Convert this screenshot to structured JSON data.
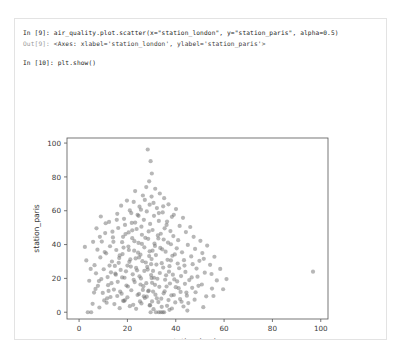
{
  "notebook": {
    "cells": [
      {
        "prompt": "In [9]:",
        "type": "input",
        "source": "air_quality.plot.scatter(x=\"station_london\", y=\"station_paris\", alpha=0.5)"
      },
      {
        "prompt": "Out[9]:",
        "type": "output",
        "source": "<Axes: xlabel='station_london', ylabel='station_paris'>"
      },
      {
        "prompt": "In [10]:",
        "type": "input",
        "source": "plt.show()"
      }
    ]
  },
  "colors": {
    "marker": "#6f6f6f",
    "axis": "#555555",
    "card_border": "#e3e3e3",
    "text": "#262626",
    "prompt_out": "#9a9a9a"
  },
  "chart_data": {
    "type": "scatter",
    "title": "",
    "xlabel": "station_london",
    "ylabel": "station_paris",
    "xlim": [
      -5,
      103
    ],
    "ylim": [
      -4,
      103
    ],
    "xticks": [
      0,
      20,
      40,
      60,
      80,
      100
    ],
    "yticks": [
      0,
      20,
      40,
      60,
      80,
      100
    ],
    "grid": false,
    "legend": false,
    "marker_alpha": 0.5,
    "marker_color": "#6f6f6f",
    "marker_size": 2.1,
    "series": [
      {
        "name": "station_london vs station_paris",
        "points": [
          [
            28.4,
            96.2
          ],
          [
            29.6,
            89.3
          ],
          [
            30.1,
            82.0
          ],
          [
            29.0,
            77.4
          ],
          [
            27.8,
            74.0
          ],
          [
            31.5,
            73.0
          ],
          [
            23.2,
            71.6
          ],
          [
            33.4,
            70.2
          ],
          [
            26.4,
            69.0
          ],
          [
            35.2,
            67.4
          ],
          [
            19.8,
            66.0
          ],
          [
            22.6,
            65.2
          ],
          [
            30.8,
            64.6
          ],
          [
            37.0,
            63.8
          ],
          [
            17.4,
            63.0
          ],
          [
            25.0,
            62.4
          ],
          [
            32.2,
            61.6
          ],
          [
            40.1,
            61.0
          ],
          [
            21.0,
            60.2
          ],
          [
            28.0,
            59.6
          ],
          [
            34.6,
            59.0
          ],
          [
            15.8,
            58.2
          ],
          [
            24.2,
            57.6
          ],
          [
            31.0,
            57.0
          ],
          [
            38.4,
            56.4
          ],
          [
            43.0,
            55.8
          ],
          [
            18.6,
            55.2
          ],
          [
            26.8,
            54.6
          ],
          [
            33.0,
            54.0
          ],
          [
            12.4,
            53.4
          ],
          [
            21.8,
            52.8
          ],
          [
            29.4,
            52.2
          ],
          [
            36.2,
            51.6
          ],
          [
            41.6,
            51.0
          ],
          [
            46.0,
            50.4
          ],
          [
            16.2,
            49.8
          ],
          [
            23.8,
            49.2
          ],
          [
            30.4,
            48.6
          ],
          [
            37.8,
            48.0
          ],
          [
            44.2,
            47.4
          ],
          [
            10.8,
            46.8
          ],
          [
            19.2,
            46.2
          ],
          [
            26.0,
            45.8
          ],
          [
            32.6,
            45.4
          ],
          [
            39.0,
            45.0
          ],
          [
            47.4,
            44.6
          ],
          [
            14.0,
            44.2
          ],
          [
            22.0,
            43.8
          ],
          [
            28.6,
            43.4
          ],
          [
            35.0,
            43.0
          ],
          [
            41.0,
            42.6
          ],
          [
            50.2,
            42.2
          ],
          [
            9.4,
            41.8
          ],
          [
            17.8,
            41.4
          ],
          [
            24.6,
            41.0
          ],
          [
            31.2,
            40.6
          ],
          [
            38.0,
            40.2
          ],
          [
            45.0,
            39.8
          ],
          [
            53.0,
            39.4
          ],
          [
            12.8,
            39.0
          ],
          [
            20.4,
            38.8
          ],
          [
            27.0,
            38.4
          ],
          [
            33.6,
            38.0
          ],
          [
            40.4,
            37.8
          ],
          [
            48.0,
            37.4
          ],
          [
            7.6,
            37.0
          ],
          [
            15.4,
            36.8
          ],
          [
            22.8,
            36.4
          ],
          [
            29.2,
            36.0
          ],
          [
            35.8,
            35.8
          ],
          [
            42.6,
            35.4
          ],
          [
            51.0,
            35.0
          ],
          [
            11.2,
            34.8
          ],
          [
            18.0,
            34.4
          ],
          [
            25.4,
            34.0
          ],
          [
            31.8,
            33.8
          ],
          [
            38.6,
            33.4
          ],
          [
            46.4,
            33.0
          ],
          [
            56.0,
            32.8
          ],
          [
            8.8,
            32.4
          ],
          [
            16.6,
            32.0
          ],
          [
            23.4,
            31.8
          ],
          [
            30.0,
            31.4
          ],
          [
            36.6,
            31.0
          ],
          [
            43.4,
            30.8
          ],
          [
            49.8,
            30.4
          ],
          [
            13.6,
            30.0
          ],
          [
            20.8,
            29.8
          ],
          [
            27.6,
            29.4
          ],
          [
            34.2,
            29.0
          ],
          [
            40.8,
            28.8
          ],
          [
            47.0,
            28.4
          ],
          [
            54.2,
            28.0
          ],
          [
            6.4,
            27.8
          ],
          [
            14.8,
            27.4
          ],
          [
            21.4,
            27.0
          ],
          [
            28.2,
            26.8
          ],
          [
            34.8,
            26.4
          ],
          [
            41.4,
            26.0
          ],
          [
            48.6,
            25.8
          ],
          [
            10.2,
            25.4
          ],
          [
            17.2,
            25.0
          ],
          [
            24.0,
            24.8
          ],
          [
            30.6,
            24.4
          ],
          [
            37.2,
            24.0
          ],
          [
            44.0,
            23.8
          ],
          [
            52.0,
            23.4
          ],
          [
            96.8,
            24.0
          ],
          [
            7.0,
            23.0
          ],
          [
            15.0,
            22.8
          ],
          [
            22.2,
            22.4
          ],
          [
            29.8,
            22.0
          ],
          [
            36.0,
            21.8
          ],
          [
            42.2,
            21.4
          ],
          [
            49.0,
            21.0
          ],
          [
            11.8,
            20.8
          ],
          [
            18.8,
            20.4
          ],
          [
            25.6,
            20.0
          ],
          [
            32.4,
            19.8
          ],
          [
            39.4,
            19.4
          ],
          [
            45.6,
            19.0
          ],
          [
            57.0,
            18.8
          ],
          [
            8.2,
            18.4
          ],
          [
            16.0,
            18.0
          ],
          [
            23.0,
            17.8
          ],
          [
            30.2,
            17.4
          ],
          [
            37.6,
            17.0
          ],
          [
            43.8,
            16.8
          ],
          [
            50.8,
            16.4
          ],
          [
            12.0,
            16.0
          ],
          [
            19.6,
            15.8
          ],
          [
            26.6,
            15.4
          ],
          [
            33.2,
            15.0
          ],
          [
            40.0,
            14.8
          ],
          [
            46.8,
            14.4
          ],
          [
            55.0,
            14.0
          ],
          [
            6.8,
            13.8
          ],
          [
            14.4,
            13.4
          ],
          [
            21.6,
            13.0
          ],
          [
            28.8,
            12.8
          ],
          [
            35.4,
            12.4
          ],
          [
            42.0,
            12.0
          ],
          [
            48.2,
            11.8
          ],
          [
            9.8,
            11.4
          ],
          [
            17.6,
            11.0
          ],
          [
            24.8,
            10.8
          ],
          [
            31.6,
            10.4
          ],
          [
            38.2,
            10.0
          ],
          [
            44.6,
            9.8
          ],
          [
            52.6,
            9.4
          ],
          [
            13.0,
            9.0
          ],
          [
            20.0,
            8.8
          ],
          [
            27.2,
            8.4
          ],
          [
            34.0,
            8.0
          ],
          [
            41.8,
            7.8
          ],
          [
            47.8,
            7.4
          ],
          [
            10.4,
            7.0
          ],
          [
            18.2,
            6.8
          ],
          [
            25.2,
            6.4
          ],
          [
            32.8,
            6.0
          ],
          [
            39.8,
            5.8
          ],
          [
            45.2,
            5.4
          ],
          [
            5.6,
            5.0
          ],
          [
            14.6,
            4.8
          ],
          [
            22.4,
            4.4
          ],
          [
            29.2,
            4.0
          ],
          [
            36.4,
            3.8
          ],
          [
            43.2,
            3.4
          ],
          [
            51.4,
            3.0
          ],
          [
            8.4,
            2.8
          ],
          [
            16.8,
            2.4
          ],
          [
            23.6,
            2.0
          ],
          [
            30.8,
            1.8
          ],
          [
            37.4,
            1.4
          ],
          [
            44.8,
            1.0
          ],
          [
            3.6,
            0.0
          ],
          [
            5.0,
            0.0
          ],
          [
            29.6,
            0.0
          ],
          [
            31.8,
            0.0
          ],
          [
            33.0,
            0.0
          ],
          [
            33.8,
            0.0
          ],
          [
            34.6,
            0.0
          ],
          [
            35.2,
            0.0
          ],
          [
            20.5,
            47.2
          ],
          [
            25.8,
            50.6
          ],
          [
            33.8,
            46.4
          ],
          [
            27.4,
            44.0
          ],
          [
            22.9,
            42.0
          ],
          [
            31.4,
            39.2
          ],
          [
            36.8,
            41.2
          ],
          [
            18.4,
            38.2
          ],
          [
            24.4,
            35.2
          ],
          [
            29.0,
            33.2
          ],
          [
            34.4,
            37.2
          ],
          [
            39.6,
            34.2
          ],
          [
            21.2,
            31.2
          ],
          [
            26.2,
            30.2
          ],
          [
            32.0,
            28.2
          ],
          [
            37.4,
            27.2
          ],
          [
            16.4,
            29.2
          ],
          [
            23.6,
            26.2
          ],
          [
            28.4,
            25.2
          ],
          [
            33.4,
            23.2
          ],
          [
            38.8,
            22.2
          ],
          [
            19.4,
            24.2
          ],
          [
            25.0,
            21.2
          ],
          [
            30.0,
            20.2
          ],
          [
            35.6,
            19.2
          ],
          [
            40.6,
            18.2
          ],
          [
            15.2,
            22.2
          ],
          [
            22.6,
            19.2
          ],
          [
            27.8,
            17.2
          ],
          [
            31.4,
            16.2
          ],
          [
            36.2,
            15.2
          ],
          [
            41.2,
            14.2
          ],
          [
            13.4,
            17.2
          ],
          [
            20.2,
            15.2
          ],
          [
            26.4,
            13.2
          ],
          [
            30.6,
            12.2
          ],
          [
            35.0,
            11.2
          ],
          [
            39.2,
            10.2
          ],
          [
            17.0,
            12.2
          ],
          [
            24.2,
            10.2
          ],
          [
            28.0,
            9.2
          ],
          [
            32.2,
            8.2
          ],
          [
            37.0,
            7.2
          ],
          [
            42.4,
            6.2
          ],
          [
            11.6,
            8.2
          ],
          [
            19.0,
            7.2
          ],
          [
            25.8,
            5.2
          ],
          [
            29.4,
            4.2
          ],
          [
            34.2,
            3.2
          ],
          [
            38.4,
            2.2
          ],
          [
            23.2,
            53.0
          ],
          [
            28.8,
            47.8
          ],
          [
            32.8,
            43.6
          ],
          [
            26.0,
            40.4
          ],
          [
            30.4,
            36.4
          ],
          [
            24.8,
            32.4
          ],
          [
            29.8,
            28.4
          ],
          [
            27.0,
            24.4
          ],
          [
            31.0,
            20.4
          ],
          [
            25.4,
            16.4
          ],
          [
            28.6,
            12.4
          ],
          [
            26.8,
            9.4
          ],
          [
            30.2,
            6.4
          ],
          [
            22.0,
            48.4
          ],
          [
            35.4,
            49.6
          ],
          [
            20.6,
            36.8
          ],
          [
            38.0,
            30.6
          ],
          [
            17.8,
            20.6
          ],
          [
            43.6,
            27.6
          ],
          [
            12.6,
            27.6
          ],
          [
            46.6,
            20.6
          ],
          [
            51.6,
            31.6
          ],
          [
            58.4,
            25.6
          ],
          [
            61.0,
            19.6
          ],
          [
            54.8,
            22.6
          ],
          [
            49.4,
            15.6
          ],
          [
            44.4,
            11.6
          ],
          [
            55.6,
            9.6
          ],
          [
            59.6,
            13.6
          ],
          [
            4.2,
            18.6
          ],
          [
            3.0,
            30.6
          ],
          [
            5.8,
            41.6
          ],
          [
            7.2,
            49.6
          ],
          [
            9.0,
            56.6
          ],
          [
            6.2,
            11.6
          ],
          [
            4.8,
            25.6
          ],
          [
            2.4,
            38.6
          ],
          [
            8.6,
            44.6
          ],
          [
            10.6,
            35.6
          ],
          [
            13.8,
            47.6
          ],
          [
            11.0,
            52.6
          ],
          [
            15.6,
            54.6
          ],
          [
            19.0,
            51.6
          ],
          [
            24.6,
            57.0
          ],
          [
            27.2,
            66.4
          ],
          [
            33.0,
            58.6
          ],
          [
            36.4,
            53.6
          ],
          [
            30.0,
            68.4
          ],
          [
            25.6,
            60.6
          ],
          [
            21.6,
            58.6
          ],
          [
            34.8,
            62.6
          ],
          [
            39.2,
            57.6
          ],
          [
            29.2,
            63.6
          ],
          [
            18.2,
            44.6
          ],
          [
            14.2,
            41.6
          ],
          [
            16.8,
            33.6
          ],
          [
            20.0,
            27.6
          ],
          [
            13.2,
            23.6
          ],
          [
            9.2,
            19.6
          ],
          [
            7.8,
            15.6
          ],
          [
            12.2,
            12.6
          ],
          [
            15.8,
            9.6
          ],
          [
            18.6,
            6.6
          ],
          [
            21.0,
            3.6
          ],
          [
            11.4,
            5.6
          ]
        ]
      }
    ]
  }
}
